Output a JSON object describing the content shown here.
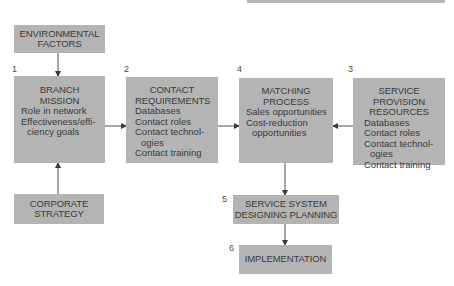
{
  "diagram": {
    "type": "flowchart",
    "colors": {
      "box_fill": "#b4b4b4",
      "text": "#3a3a3a",
      "arrow": "#3a3a3a",
      "background": "#ffffff"
    },
    "nodes": {
      "environmental_factors": {
        "title_lines": [
          "ENVIRONMENTAL",
          "FACTORS"
        ]
      },
      "branch_mission": {
        "number": "1",
        "title_lines": [
          "BRANCH",
          "MISSION"
        ],
        "items": [
          "Role in network",
          "Effectiveness/effi-",
          "ciency goals"
        ]
      },
      "contact_requirements": {
        "number": "2",
        "title_lines": [
          "CONTACT",
          "REQUIREMENTS"
        ],
        "items": [
          "Databases",
          "Contact roles",
          "Contact technol-",
          "ogies",
          "Contact training"
        ]
      },
      "matching_process": {
        "number": "4",
        "title_lines": [
          "MATCHING",
          "PROCESS"
        ],
        "items": [
          "Sales opportunities",
          "Cost-reduction",
          "opportunities"
        ]
      },
      "service_provision_resources": {
        "number": "3",
        "title_lines": [
          "SERVICE",
          "PROVISION",
          "RESOURCES"
        ],
        "items": [
          "Databases",
          "Contact roles",
          "Contact technol-",
          "ogies",
          "Contact training"
        ]
      },
      "corporate_strategy": {
        "title_lines": [
          "CORPORATE",
          "STRATEGY"
        ]
      },
      "service_system": {
        "number": "5",
        "title_lines": [
          "SERVICE SYSTEM",
          "DESIGNING PLANNING"
        ]
      },
      "implementation": {
        "number": "6",
        "title_lines": [
          "IMPLEMENTATION"
        ]
      }
    },
    "edges": [
      {
        "from": "environmental_factors",
        "to": "branch_mission"
      },
      {
        "from": "corporate_strategy",
        "to": "branch_mission"
      },
      {
        "from": "branch_mission",
        "to": "contact_requirements"
      },
      {
        "from": "contact_requirements",
        "to": "matching_process"
      },
      {
        "from": "service_provision_resources",
        "to": "matching_process"
      },
      {
        "from": "matching_process",
        "to": "service_system"
      },
      {
        "from": "service_system",
        "to": "implementation"
      }
    ]
  }
}
